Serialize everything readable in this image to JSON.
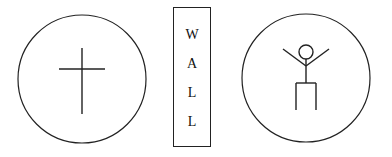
{
  "diagram": {
    "left_circle": {
      "symbol": "cross-icon"
    },
    "wall": {
      "letters": [
        "W",
        "A",
        "L",
        "L"
      ],
      "label": "WALL"
    },
    "right_circle": {
      "symbol": "stick-figure-icon"
    }
  },
  "colors": {
    "stroke": "#222222",
    "background": "#ffffff"
  }
}
